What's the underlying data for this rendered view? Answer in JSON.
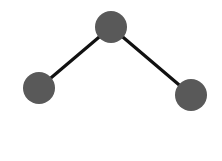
{
  "diagram": {
    "width": 222,
    "height": 161,
    "background": "#ffffff",
    "edge_color": "#111111",
    "edge_width": 3.2,
    "node_color": "#595959",
    "nodes": [
      {
        "id": "left",
        "cx": 39,
        "cy": 88,
        "r": 16
      },
      {
        "id": "top",
        "cx": 111,
        "cy": 27,
        "r": 16
      },
      {
        "id": "right",
        "cx": 191,
        "cy": 95,
        "r": 16
      }
    ],
    "edges": [
      {
        "from": "left",
        "to": "top"
      },
      {
        "from": "top",
        "to": "right"
      }
    ]
  }
}
